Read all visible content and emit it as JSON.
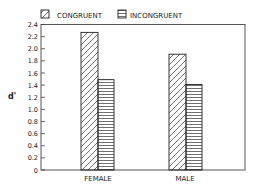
{
  "chart_data": {
    "type": "bar",
    "title": "",
    "xlabel": "",
    "ylabel": "d'",
    "categories": [
      "FEMALE",
      "MALE"
    ],
    "series": [
      {
        "name": "CONGRUENT",
        "pattern": "diagonal-hatch",
        "values": [
          2.27,
          1.91
        ]
      },
      {
        "name": "INCONGRUENT",
        "pattern": "horizontal-hatch",
        "values": [
          1.49,
          1.41
        ]
      }
    ],
    "ylim": [
      0,
      2.4
    ],
    "yticks": [
      "0",
      "0.2",
      "0.4",
      "0.6",
      "0.8",
      "1.0",
      "1.2",
      "1.4",
      "1.6",
      "1.8",
      "2.0",
      "2.2",
      "2.4"
    ],
    "grid": false,
    "legend_position": "top",
    "colors": {
      "ink": "#222222",
      "background": "#ffffff"
    }
  }
}
